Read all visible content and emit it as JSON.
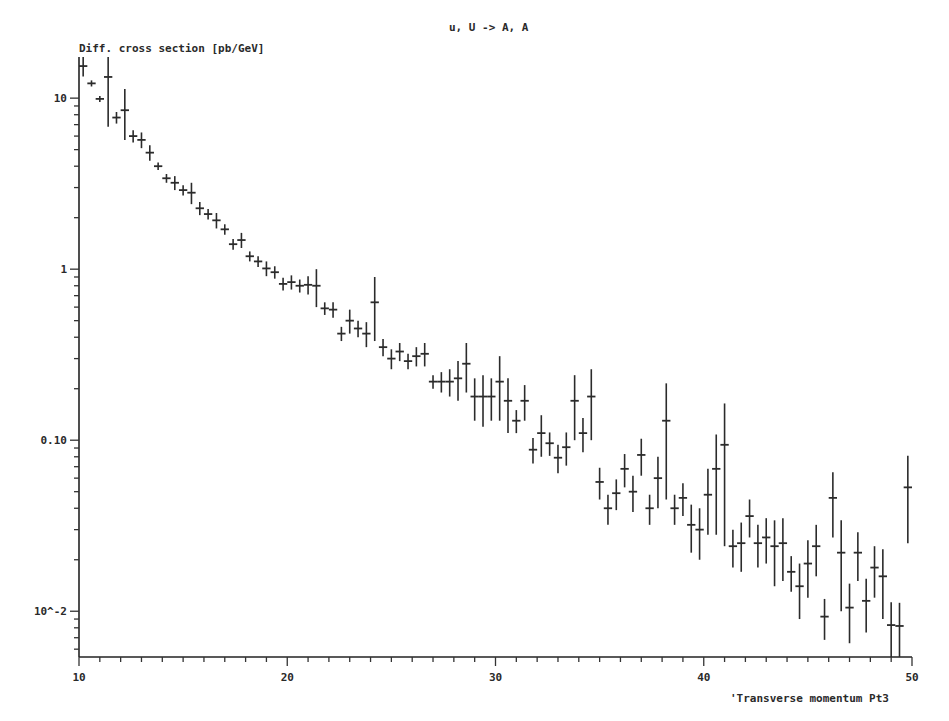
{
  "chart_data": {
    "type": "scatter",
    "title": "u, U -> A, A",
    "ylabel": "Diff. cross section [pb/GeV]",
    "xlabel": "'Transverse momentum Pt3",
    "xlim": [
      10,
      50
    ],
    "ylim": [
      0.0054,
      17.4
    ],
    "yscale": "log",
    "grid": false,
    "legend": "none",
    "x_ticks": [
      {
        "value": 10,
        "label": "10"
      },
      {
        "value": 20,
        "label": "20"
      },
      {
        "value": 30,
        "label": "30"
      },
      {
        "value": 40,
        "label": "40"
      },
      {
        "value": 50,
        "label": "50"
      }
    ],
    "y_ticks": [
      {
        "value": 10,
        "label": "10"
      },
      {
        "value": 1,
        "label": "1"
      },
      {
        "value": 0.1,
        "label": "0.10"
      },
      {
        "value": 0.01,
        "label": "10^-2"
      }
    ],
    "bin_width": 0.4,
    "series": [
      {
        "name": "cross-section",
        "points": [
          {
            "x": 10.2,
            "y": 15.4,
            "err": 2.0
          },
          {
            "x": 10.6,
            "y": 12.2,
            "err": 0.5
          },
          {
            "x": 11.0,
            "y": 9.9,
            "err": 0.4
          },
          {
            "x": 11.4,
            "y": 13.3,
            "err": 6.5
          },
          {
            "x": 11.8,
            "y": 7.7,
            "err": 0.6
          },
          {
            "x": 12.2,
            "y": 8.5,
            "err": 2.8
          },
          {
            "x": 12.6,
            "y": 6.0,
            "err": 0.5
          },
          {
            "x": 13.0,
            "y": 5.7,
            "err": 0.6
          },
          {
            "x": 13.4,
            "y": 4.8,
            "err": 0.5
          },
          {
            "x": 13.8,
            "y": 4.0,
            "err": 0.2
          },
          {
            "x": 14.2,
            "y": 3.4,
            "err": 0.2
          },
          {
            "x": 14.6,
            "y": 3.2,
            "err": 0.3
          },
          {
            "x": 15.0,
            "y": 2.9,
            "err": 0.2
          },
          {
            "x": 15.4,
            "y": 2.8,
            "err": 0.4
          },
          {
            "x": 15.8,
            "y": 2.27,
            "err": 0.2
          },
          {
            "x": 16.2,
            "y": 2.1,
            "err": 0.15
          },
          {
            "x": 16.6,
            "y": 1.93,
            "err": 0.2
          },
          {
            "x": 17.0,
            "y": 1.71,
            "err": 0.12
          },
          {
            "x": 17.4,
            "y": 1.4,
            "err": 0.1
          },
          {
            "x": 17.8,
            "y": 1.48,
            "err": 0.15
          },
          {
            "x": 18.2,
            "y": 1.19,
            "err": 0.08
          },
          {
            "x": 18.6,
            "y": 1.11,
            "err": 0.08
          },
          {
            "x": 19.0,
            "y": 1.01,
            "err": 0.1
          },
          {
            "x": 19.4,
            "y": 0.96,
            "err": 0.08
          },
          {
            "x": 19.8,
            "y": 0.82,
            "err": 0.07
          },
          {
            "x": 20.2,
            "y": 0.84,
            "err": 0.08
          },
          {
            "x": 20.6,
            "y": 0.8,
            "err": 0.07
          },
          {
            "x": 21.0,
            "y": 0.81,
            "err": 0.1
          },
          {
            "x": 21.4,
            "y": 0.8,
            "err": 0.2
          },
          {
            "x": 21.8,
            "y": 0.59,
            "err": 0.05
          },
          {
            "x": 22.2,
            "y": 0.58,
            "err": 0.06
          },
          {
            "x": 22.6,
            "y": 0.42,
            "err": 0.04
          },
          {
            "x": 23.0,
            "y": 0.5,
            "err": 0.08
          },
          {
            "x": 23.4,
            "y": 0.45,
            "err": 0.05
          },
          {
            "x": 23.8,
            "y": 0.42,
            "err": 0.07
          },
          {
            "x": 24.2,
            "y": 0.64,
            "err": 0.26
          },
          {
            "x": 24.6,
            "y": 0.35,
            "err": 0.04
          },
          {
            "x": 25.0,
            "y": 0.3,
            "err": 0.04
          },
          {
            "x": 25.4,
            "y": 0.33,
            "err": 0.04
          },
          {
            "x": 25.8,
            "y": 0.29,
            "err": 0.03
          },
          {
            "x": 26.2,
            "y": 0.31,
            "err": 0.04
          },
          {
            "x": 26.6,
            "y": 0.32,
            "err": 0.05
          },
          {
            "x": 27.0,
            "y": 0.22,
            "err": 0.02
          },
          {
            "x": 27.4,
            "y": 0.22,
            "err": 0.03
          },
          {
            "x": 27.8,
            "y": 0.22,
            "err": 0.04
          },
          {
            "x": 28.2,
            "y": 0.23,
            "err": 0.06
          },
          {
            "x": 28.6,
            "y": 0.28,
            "err": 0.09
          },
          {
            "x": 29.0,
            "y": 0.18,
            "err": 0.05
          },
          {
            "x": 29.4,
            "y": 0.18,
            "err": 0.06
          },
          {
            "x": 29.8,
            "y": 0.18,
            "err": 0.05
          },
          {
            "x": 30.2,
            "y": 0.22,
            "err": 0.09
          },
          {
            "x": 30.6,
            "y": 0.17,
            "err": 0.06
          },
          {
            "x": 31.0,
            "y": 0.13,
            "err": 0.02
          },
          {
            "x": 31.4,
            "y": 0.17,
            "err": 0.04
          },
          {
            "x": 31.8,
            "y": 0.088,
            "err": 0.015
          },
          {
            "x": 32.2,
            "y": 0.11,
            "err": 0.03
          },
          {
            "x": 32.6,
            "y": 0.096,
            "err": 0.015
          },
          {
            "x": 33.0,
            "y": 0.079,
            "err": 0.015
          },
          {
            "x": 33.4,
            "y": 0.091,
            "err": 0.02
          },
          {
            "x": 33.8,
            "y": 0.17,
            "err": 0.07
          },
          {
            "x": 34.2,
            "y": 0.11,
            "err": 0.025
          },
          {
            "x": 34.6,
            "y": 0.18,
            "err": 0.08
          },
          {
            "x": 35.0,
            "y": 0.057,
            "err": 0.012
          },
          {
            "x": 35.4,
            "y": 0.04,
            "err": 0.008
          },
          {
            "x": 35.8,
            "y": 0.049,
            "err": 0.01
          },
          {
            "x": 36.2,
            "y": 0.068,
            "err": 0.015
          },
          {
            "x": 36.6,
            "y": 0.05,
            "err": 0.012
          },
          {
            "x": 37.0,
            "y": 0.082,
            "err": 0.02
          },
          {
            "x": 37.4,
            "y": 0.04,
            "err": 0.008
          },
          {
            "x": 37.8,
            "y": 0.06,
            "err": 0.02
          },
          {
            "x": 38.2,
            "y": 0.13,
            "err": 0.085
          },
          {
            "x": 38.6,
            "y": 0.04,
            "err": 0.008
          },
          {
            "x": 39.0,
            "y": 0.046,
            "err": 0.01
          },
          {
            "x": 39.4,
            "y": 0.032,
            "err": 0.01
          },
          {
            "x": 39.8,
            "y": 0.03,
            "err": 0.01
          },
          {
            "x": 40.2,
            "y": 0.048,
            "err": 0.02
          },
          {
            "x": 40.6,
            "y": 0.068,
            "err": 0.04
          },
          {
            "x": 41.0,
            "y": 0.094,
            "err": 0.07
          },
          {
            "x": 41.4,
            "y": 0.024,
            "err": 0.006
          },
          {
            "x": 41.8,
            "y": 0.025,
            "err": 0.008
          },
          {
            "x": 42.2,
            "y": 0.036,
            "err": 0.009
          },
          {
            "x": 42.6,
            "y": 0.025,
            "err": 0.007
          },
          {
            "x": 43.0,
            "y": 0.027,
            "err": 0.008
          },
          {
            "x": 43.4,
            "y": 0.024,
            "err": 0.01
          },
          {
            "x": 43.8,
            "y": 0.025,
            "err": 0.01
          },
          {
            "x": 44.2,
            "y": 0.017,
            "err": 0.004
          },
          {
            "x": 44.6,
            "y": 0.014,
            "err": 0.005
          },
          {
            "x": 45.0,
            "y": 0.019,
            "err": 0.007
          },
          {
            "x": 45.4,
            "y": 0.024,
            "err": 0.008
          },
          {
            "x": 45.8,
            "y": 0.0093,
            "err": 0.0025
          },
          {
            "x": 46.2,
            "y": 0.046,
            "err": 0.019
          },
          {
            "x": 46.6,
            "y": 0.022,
            "err": 0.012
          },
          {
            "x": 47.0,
            "y": 0.0105,
            "err": 0.004
          },
          {
            "x": 47.4,
            "y": 0.022,
            "err": 0.007
          },
          {
            "x": 47.8,
            "y": 0.0115,
            "err": 0.004
          },
          {
            "x": 48.2,
            "y": 0.018,
            "err": 0.006
          },
          {
            "x": 48.6,
            "y": 0.016,
            "err": 0.007
          },
          {
            "x": 49.0,
            "y": 0.0083,
            "err": 0.003
          },
          {
            "x": 49.4,
            "y": 0.0082,
            "err": 0.003
          },
          {
            "x": 49.8,
            "y": 0.053,
            "err": 0.028
          }
        ]
      }
    ]
  }
}
